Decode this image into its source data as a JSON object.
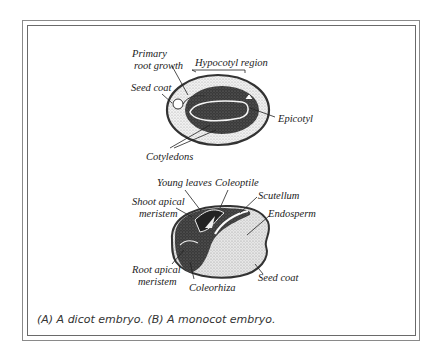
{
  "figure": {
    "dicot": {
      "labels": {
        "primary_root_growth_1": "Primary",
        "primary_root_growth_2": "root growth",
        "hypocotyl_region": "Hypocotyl region",
        "seed_coat": "Seed coat",
        "epicotyl": "Epicotyl",
        "cotyledons": "Cotyledons"
      }
    },
    "monocot": {
      "labels": {
        "young_leaves": "Young leaves",
        "coleoptile": "Coleoptile",
        "scutellum": "Scutellum",
        "shoot_apical_1": "Shoot apical",
        "shoot_apical_2": "meristem",
        "endosperm": "Endosperm",
        "root_apical_1": "Root apical",
        "root_apical_2": "meristem",
        "coleorhiza": "Coleorhiza",
        "seed_coat": "Seed coat"
      }
    },
    "caption": "(A) A dicot embryo. (B) A monocot embryo."
  },
  "colors": {
    "frame": "#7a7a7a",
    "dark_tissue": "#333333",
    "stipple": "#bdbdbd",
    "text": "#222222"
  }
}
